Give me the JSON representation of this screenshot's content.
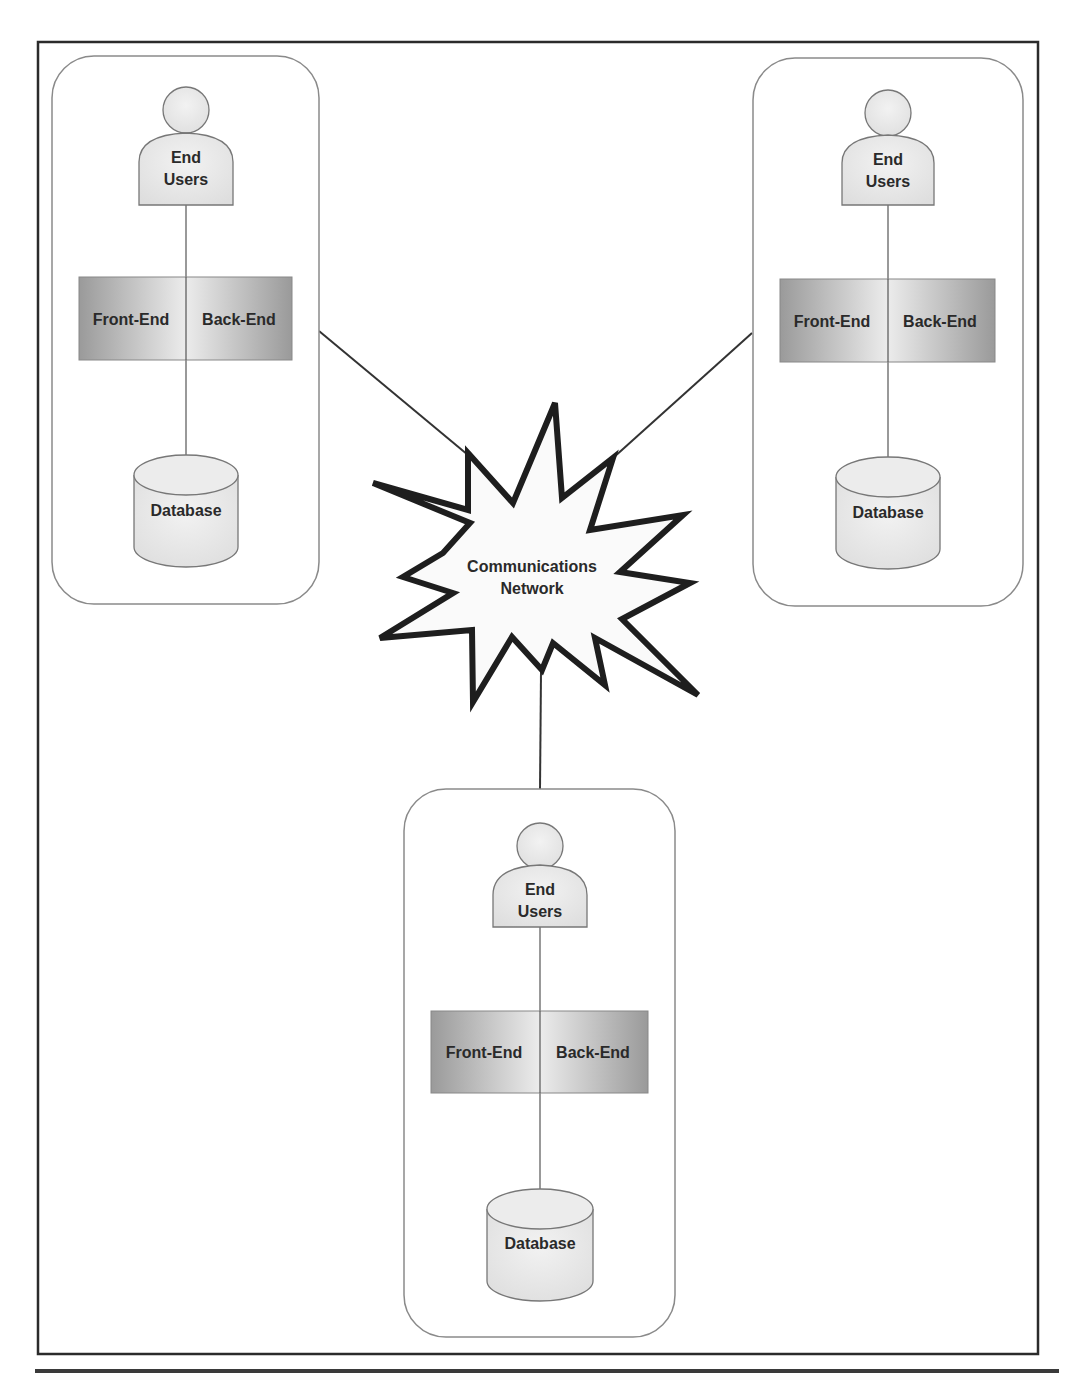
{
  "diagram": {
    "type": "network-topology",
    "hub": {
      "label_line1": "Communications",
      "label_line2": "Network",
      "shape": "explosion-star"
    },
    "nodes": [
      {
        "position": "top-left",
        "users": {
          "line1": "End",
          "line2": "Users"
        },
        "app": {
          "left": "Front-End",
          "right": "Back-End"
        },
        "database": {
          "label": "Database"
        }
      },
      {
        "position": "top-right",
        "users": {
          "line1": "End",
          "line2": "Users"
        },
        "app": {
          "left": "Front-End",
          "right": "Back-End"
        },
        "database": {
          "label": "Database"
        }
      },
      {
        "position": "bottom-center",
        "users": {
          "line1": "End",
          "line2": "Users"
        },
        "app": {
          "left": "Front-End",
          "right": "Back-End"
        },
        "database": {
          "label": "Database"
        }
      }
    ],
    "edges": [
      {
        "from": "top-left",
        "to": "hub"
      },
      {
        "from": "top-right",
        "to": "hub"
      },
      {
        "from": "bottom-center",
        "to": "hub"
      }
    ],
    "colors": {
      "frame": "#2b2b2b",
      "node_border": "#8a8a8a",
      "shape_fill": "#e8e8e8",
      "app_gradient_dark": "#9a9a9a",
      "app_gradient_light": "#ececec",
      "star_stroke": "#1e1e1e",
      "text": "#2a2a2a"
    }
  },
  "caption": {
    "visible": "clipped",
    "text": ""
  }
}
